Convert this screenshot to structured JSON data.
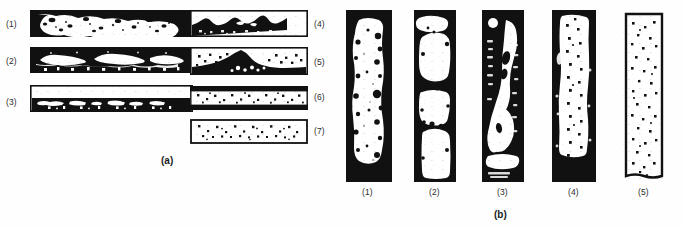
{
  "figure": {
    "background_color": "#fefefe",
    "ink_color": "#111111",
    "panels": [
      {
        "id": "a",
        "caption": "(a)",
        "orientation": "horizontal",
        "description": "Longitudinal sections showing progressive change of internal defect structure",
        "items": [
          {
            "label": "(1)",
            "column": "left",
            "pattern": "dense-porosity-full-thickness"
          },
          {
            "label": "(2)",
            "column": "left",
            "pattern": "elongated-cavities-mid-thickness"
          },
          {
            "label": "(3)",
            "column": "left",
            "pattern": "defect-band-lower-half"
          },
          {
            "label": "(4)",
            "column": "right",
            "pattern": "undulating-dark-lower-layer"
          },
          {
            "label": "(5)",
            "column": "right",
            "pattern": "dark-wedge-with-scattered-dots"
          },
          {
            "label": "(6)",
            "column": "right",
            "pattern": "dotted-core-dark-top-and-bottom-bands"
          },
          {
            "label": "(7)",
            "column": "right",
            "pattern": "uniform-scattered-dots"
          }
        ]
      },
      {
        "id": "b",
        "caption": "(b)",
        "orientation": "vertical",
        "description": "Transverse sections showing progressive change of internal defect structure",
        "items": [
          {
            "label": "(1)",
            "pattern": "dark-border-light-core-with-porosity"
          },
          {
            "label": "(2)",
            "pattern": "large-rounded-cavities-stacked"
          },
          {
            "label": "(3)",
            "pattern": "irregular-elongated-cavities-heavy-ink"
          },
          {
            "label": "(4)",
            "pattern": "dark-edges-with-dotted-core"
          },
          {
            "label": "(5)",
            "pattern": "thin-outline-with-scattered-dots"
          }
        ]
      }
    ]
  }
}
